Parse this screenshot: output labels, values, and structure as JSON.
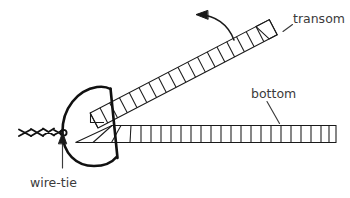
{
  "figure": {
    "background_color": "#ffffff",
    "line_color": "#1a1a1a",
    "text_color": "#3b3b3b",
    "width": 350,
    "height": 198
  },
  "labels": {
    "transom": "transom",
    "bottom": "bottom",
    "wire_tie": "wire-tie"
  },
  "parts": {
    "transom_ladder": {
      "name": "transom",
      "type": "ladder-truss",
      "orientation": "angled-up-right",
      "rung_count": 18
    },
    "bottom_ladder": {
      "name": "bottom",
      "type": "ladder-truss",
      "orientation": "horizontal",
      "rung_count": 25
    },
    "wire_tie": {
      "name": "wire-tie",
      "type": "twisted-wire",
      "twist_count": 4
    },
    "frame": {
      "name": "curved-frame",
      "type": "leaf-shaped-former"
    },
    "rotation_arrow": {
      "name": "rotation-arrow",
      "direction": "counter-clockwise-up-left"
    }
  }
}
